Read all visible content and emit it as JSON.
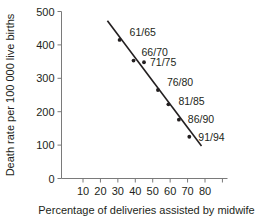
{
  "chart_data": {
    "type": "scatter",
    "title": "",
    "xlabel": "Percentage of deliveries assisted by midwife",
    "ylabel": "Death rate per 100 000 live births",
    "xlim": [
      0,
      90
    ],
    "ylim": [
      0,
      500
    ],
    "grid": false,
    "legend": "none",
    "xticks": [
      10,
      20,
      30,
      40,
      50,
      60,
      70,
      80,
      90
    ],
    "xtick_labels": [
      "10",
      "20",
      "30",
      "40",
      "50",
      "60",
      "70",
      "80",
      ""
    ],
    "yticks": [
      0,
      100,
      200,
      300,
      400,
      500
    ],
    "ytick_labels": [
      "0",
      "100",
      "200",
      "300",
      "400",
      "500"
    ],
    "points": [
      {
        "label": "61/65",
        "x": 31,
        "y": 415
      },
      {
        "label": "66/70",
        "x": 39,
        "y": 353
      },
      {
        "label": "71/75",
        "x": 45,
        "y": 348
      },
      {
        "label": "76/80",
        "x": 53,
        "y": 265
      },
      {
        "label": "81/85",
        "x": 59,
        "y": 222
      },
      {
        "label": "86/90",
        "x": 65,
        "y": 176
      },
      {
        "label": "91/94",
        "x": 71,
        "y": 125
      }
    ],
    "trendline": {
      "x1": 24,
      "y1": 472,
      "x2": 78,
      "y2": 97
    }
  }
}
